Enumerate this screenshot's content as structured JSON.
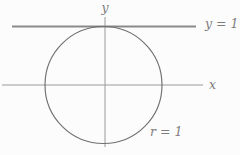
{
  "figure": {
    "type": "geometry-diagram",
    "labels": {
      "y_axis": "y",
      "x_axis": "x",
      "tangent_line": "y = 1",
      "radius": "r = 1"
    },
    "values": {
      "radius": "1",
      "tangent_line_y": "1"
    },
    "colors": {
      "background": "#fcfcfc",
      "axis": "#9b9b9b",
      "tangent_line": "#8a8a8a",
      "circle": "#6f6f6f",
      "text": "#7d7d7d"
    }
  }
}
